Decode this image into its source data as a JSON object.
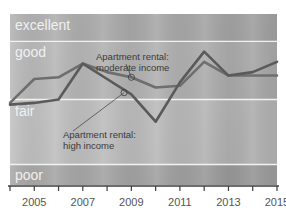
{
  "chart_data": {
    "type": "line",
    "title": "",
    "xlabel": "",
    "ylabel": "",
    "x": [
      2004,
      2005,
      2006,
      2007,
      2008,
      2009,
      2010,
      2011,
      2012,
      2013,
      2014,
      2015
    ],
    "xlim": [
      2004,
      2015
    ],
    "ylim": [
      0,
      100
    ],
    "xticks": [
      2004,
      2005,
      2006,
      2007,
      2008,
      2009,
      2010,
      2011,
      2012,
      2013,
      2014,
      2015
    ],
    "xtick_labels": [
      "",
      "2005",
      "",
      "2007",
      "",
      "2009",
      "",
      "2011",
      "",
      "2013",
      "",
      "2015"
    ],
    "grid": false,
    "legend_position": "inline-annotations",
    "bands": [
      {
        "label": "excellent",
        "y_from": 84,
        "y_to": 100,
        "color": "#a8a8a8"
      },
      {
        "label": "good",
        "y_from": 50,
        "y_to": 84,
        "color": "#b2b2b2"
      },
      {
        "label": "fair",
        "y_from": 12,
        "y_to": 50,
        "color": "#bdbdbd"
      },
      {
        "label": "poor",
        "y_from": 0,
        "y_to": 12,
        "color": "#a5a5a5"
      }
    ],
    "band_divider_color": "#f2f2f2",
    "series": [
      {
        "name": "Apartment rental: moderate income",
        "color": "#6e6e6e",
        "values": [
          48,
          62,
          63,
          71,
          66,
          63,
          57,
          58,
          72,
          64,
          64,
          64
        ]
      },
      {
        "name": "Apartment rental: high income",
        "color": "#5a5a5a",
        "values": [
          47,
          48,
          50,
          71,
          62,
          53,
          37,
          60,
          78,
          64,
          66,
          72
        ]
      }
    ],
    "annotations": [
      {
        "text_line1": "Apartment rental:",
        "text_line2": "moderate income",
        "target_x": 2009,
        "target_y": 63,
        "color": "#3a3a3a"
      },
      {
        "text_line1": "Apartment rental:",
        "text_line2": "high income",
        "target_x": 2008.7,
        "target_y": 54,
        "color": "#3a3a3a"
      }
    ]
  },
  "axis": {
    "tick_label_color": "#555555",
    "axis_line_color": "#3d3d3d"
  },
  "band_label_color": "#f0f0f0"
}
